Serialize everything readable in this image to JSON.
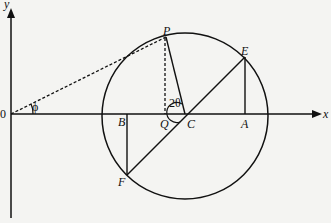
{
  "diagram": {
    "axes": {
      "x_label": "x",
      "y_label": "y",
      "origin_label": "0"
    },
    "points": {
      "P": "P",
      "E": "E",
      "Q": "Q",
      "C": "C",
      "B": "B",
      "A": "A",
      "F": "F"
    },
    "angles": {
      "phi": "ϕ",
      "two_theta": "2θ"
    }
  }
}
